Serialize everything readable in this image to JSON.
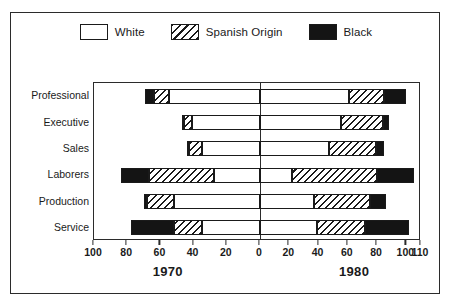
{
  "chart_data": {
    "type": "bar",
    "subtype": "back-to-back stacked horizontal bar (population pyramid)",
    "title": "",
    "xlabel": "",
    "ylabel": "",
    "grid": false,
    "legend_position": "top-center",
    "categories": [
      "Professional",
      "Executive",
      "Sales",
      "Laborers",
      "Production",
      "Service"
    ],
    "legend": [
      {
        "name": "White",
        "pattern": "open",
        "color": "#ffffff"
      },
      {
        "name": "Spanish Origin",
        "pattern": "diagonal-hatch",
        "color": "#ffffff"
      },
      {
        "name": "Black",
        "pattern": "solid",
        "color": "#141414"
      }
    ],
    "panels": [
      {
        "name": "1970",
        "side": "left",
        "axis_direction": "right-to-left",
        "xlim": [
          0,
          100
        ],
        "ticks": [
          100,
          80,
          60,
          40,
          20,
          0
        ],
        "series": [
          {
            "name": "White",
            "values": [
              55,
              41,
              35,
              28,
              52,
              35
            ]
          },
          {
            "name": "Spanish Origin",
            "values": [
              64,
              46,
              43,
              67,
              68,
              52
            ]
          },
          {
            "name": "Black",
            "values": [
              69,
              47,
              44,
              84,
              70,
              78
            ]
          }
        ]
      },
      {
        "name": "1980",
        "side": "right",
        "axis_direction": "left-to-right",
        "xlim": [
          0,
          110
        ],
        "ticks": [
          0,
          20,
          40,
          60,
          80,
          100,
          110
        ],
        "series": [
          {
            "name": "White",
            "values": [
              61,
              55,
              47,
              22,
              37,
              39
            ]
          },
          {
            "name": "Spanish Origin",
            "values": [
              85,
              84,
              79,
              80,
              75,
              72
            ]
          },
          {
            "name": "Black",
            "values": [
              100,
              88,
              85,
              105,
              86,
              102
            ]
          }
        ]
      }
    ]
  },
  "axis": {
    "left_ticks": [
      "100",
      "80",
      "60",
      "40",
      "20",
      "0"
    ],
    "right_ticks": [
      "20",
      "40",
      "60",
      "80",
      "100",
      "110"
    ],
    "year_left": "1970",
    "year_right": "1980"
  }
}
